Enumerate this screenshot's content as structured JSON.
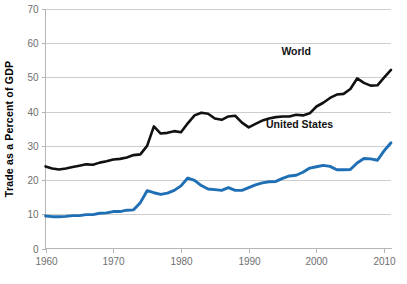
{
  "chart_data": {
    "type": "line",
    "title": "",
    "xlabel": "",
    "ylabel": "Trade as a Percent of GDP",
    "xlim": [
      1960,
      2011
    ],
    "ylim": [
      0,
      70
    ],
    "grid": true,
    "grid_axis": "y",
    "legend_position": "inline-annotation",
    "xticks": [
      1960,
      1970,
      1980,
      1990,
      2000,
      2010
    ],
    "xtick_labels": [
      "1960",
      "1970",
      "1980",
      "1990",
      "2000",
      "2010"
    ],
    "yticks": [
      0,
      10,
      20,
      30,
      40,
      50,
      60,
      70
    ],
    "ytick_labels": [
      "0",
      "10",
      "20",
      "30",
      "40",
      "50",
      "60",
      "70"
    ],
    "x": [
      1960,
      1961,
      1962,
      1963,
      1964,
      1965,
      1966,
      1967,
      1968,
      1969,
      1970,
      1971,
      1972,
      1973,
      1974,
      1975,
      1976,
      1977,
      1978,
      1979,
      1980,
      1981,
      1982,
      1983,
      1984,
      1985,
      1986,
      1987,
      1988,
      1989,
      1990,
      1991,
      1992,
      1993,
      1994,
      1995,
      1996,
      1997,
      1998,
      1999,
      2000,
      2001,
      2002,
      2003,
      2004,
      2005,
      2006,
      2007,
      2008,
      2009,
      2010,
      2011
    ],
    "series": [
      {
        "name": "World",
        "color": "#111111",
        "linewidth": 2.6,
        "label_text": "World",
        "values": [
          24.0,
          23.4,
          23.1,
          23.4,
          23.8,
          24.2,
          24.6,
          24.5,
          25.1,
          25.5,
          26.0,
          26.2,
          26.6,
          27.3,
          27.5,
          30.0,
          35.7,
          33.6,
          33.8,
          34.3,
          34.0,
          36.6,
          38.9,
          39.7,
          39.4,
          38.0,
          37.6,
          38.6,
          38.8,
          36.8,
          35.4,
          36.4,
          37.4,
          38.0,
          38.4,
          38.6,
          38.6,
          39.1,
          38.9,
          39.5,
          41.5,
          42.6,
          44.0,
          45.0,
          45.2,
          46.6,
          49.7,
          48.4,
          47.6,
          47.7,
          50.0,
          52.2
        ]
      },
      {
        "name": "United States",
        "color": "#1f6fb5",
        "linewidth": 2.9,
        "label_text": "United States",
        "values": [
          9.5,
          9.3,
          9.3,
          9.4,
          9.6,
          9.6,
          9.9,
          9.9,
          10.3,
          10.4,
          10.8,
          10.8,
          11.2,
          11.3,
          13.4,
          16.9,
          16.3,
          15.8,
          16.2,
          17.0,
          18.3,
          20.6,
          19.9,
          18.4,
          17.4,
          17.2,
          17.0,
          17.8,
          17.0,
          17.0,
          17.8,
          18.6,
          19.2,
          19.5,
          19.6,
          20.5,
          21.2,
          21.4,
          22.3,
          23.5,
          23.9,
          24.3,
          24.0,
          23.0,
          23.0,
          23.1,
          25.0,
          26.3,
          26.2,
          25.8,
          28.6,
          30.9
        ]
      }
    ],
    "annotations": [
      {
        "name": "world-series-label",
        "text": "World",
        "x": 1997.0,
        "y": 56.5
      },
      {
        "name": "united-states-series-label",
        "text": "United States",
        "x": 1997.5,
        "y": 35.2
      }
    ]
  },
  "colors": {
    "world_line": "#111111",
    "us_line": "#1f6fb5",
    "gridline": "#c9c9c9",
    "axis": "#b5b5b5",
    "tick_text": "#6f6f6f",
    "axis_title_text": "#000000",
    "background": "#ffffff"
  }
}
